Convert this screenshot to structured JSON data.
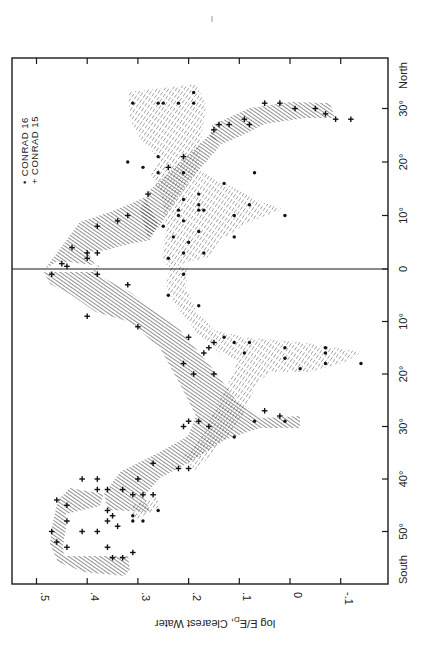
{
  "chart_data": {
    "type": "scatter",
    "title": "",
    "orientation": "rotated 90 degrees (value axis along bottom, latitude along right side)",
    "xlabel": "Latitude",
    "ylabel": "log E/E_D , Clearest Water",
    "value_axis": {
      "label": "log E/E",
      "label_sub": "D",
      "label_tail": ", Clearest Water",
      "ticks": [
        0.5,
        0.4,
        0.3,
        0.2,
        0.1,
        0,
        -0.1
      ],
      "tick_labels": [
        ".5",
        ".4",
        ".3",
        ".2",
        ".1",
        "0",
        "-.1"
      ],
      "range": [
        0.55,
        -0.19
      ]
    },
    "latitude_axis": {
      "ticks": [
        30,
        20,
        10,
        0,
        -10,
        -20,
        -30,
        -40,
        -50
      ],
      "tick_labels": [
        "30°",
        "20°",
        "10°",
        "0",
        "10°",
        "20°",
        "30°",
        "40°",
        "50°"
      ],
      "north_label": "North",
      "south_label": "South",
      "range": [
        -58,
        39
      ]
    },
    "legend": {
      "position": "upper-left inside frame (rotated text)",
      "entries": [
        {
          "marker": "dot",
          "symbol": "•",
          "label": "CONRAD 16"
        },
        {
          "marker": "plus",
          "symbol": "+",
          "label": "CONRAD 15"
        }
      ]
    },
    "grid": false,
    "reference_line": {
      "latitude": 0,
      "label": "Equator"
    },
    "series": [
      {
        "name": "CONRAD 15",
        "marker": "+",
        "hatch": "dense diagonal",
        "points": [
          {
            "lat": 31,
            "v": 0.05
          },
          {
            "lat": 31,
            "v": 0.02
          },
          {
            "lat": 30,
            "v": -0.01
          },
          {
            "lat": 30,
            "v": -0.05
          },
          {
            "lat": 29,
            "v": -0.07
          },
          {
            "lat": 28,
            "v": -0.09
          },
          {
            "lat": 28,
            "v": -0.12
          },
          {
            "lat": 28,
            "v": 0.09
          },
          {
            "lat": 27,
            "v": 0.08
          },
          {
            "lat": 27,
            "v": 0.12
          },
          {
            "lat": 27,
            "v": 0.14
          },
          {
            "lat": 26,
            "v": 0.15
          },
          {
            "lat": 21,
            "v": 0.21
          },
          {
            "lat": 19,
            "v": 0.24
          },
          {
            "lat": 14,
            "v": 0.28
          },
          {
            "lat": 10,
            "v": 0.32
          },
          {
            "lat": 9,
            "v": 0.34
          },
          {
            "lat": 8,
            "v": 0.38
          },
          {
            "lat": 4,
            "v": 0.43
          },
          {
            "lat": 3,
            "v": 0.4
          },
          {
            "lat": 3,
            "v": 0.38
          },
          {
            "lat": 2,
            "v": 0.4
          },
          {
            "lat": 1,
            "v": 0.45
          },
          {
            "lat": 0.5,
            "v": 0.44
          },
          {
            "lat": -1,
            "v": 0.47
          },
          {
            "lat": -1,
            "v": 0.38
          },
          {
            "lat": -3,
            "v": 0.32
          },
          {
            "lat": -9,
            "v": 0.4
          },
          {
            "lat": -11,
            "v": 0.3
          },
          {
            "lat": -13,
            "v": 0.2
          },
          {
            "lat": -14,
            "v": 0.15
          },
          {
            "lat": -15,
            "v": 0.16
          },
          {
            "lat": -16,
            "v": 0.17
          },
          {
            "lat": -18,
            "v": 0.21
          },
          {
            "lat": -20,
            "v": 0.19
          },
          {
            "lat": -20,
            "v": 0.15
          },
          {
            "lat": -27,
            "v": 0.05
          },
          {
            "lat": -28,
            "v": 0.02
          },
          {
            "lat": -29,
            "v": 0.2
          },
          {
            "lat": -29,
            "v": 0.18
          },
          {
            "lat": -30,
            "v": 0.16
          },
          {
            "lat": -30,
            "v": 0.21
          },
          {
            "lat": -37,
            "v": 0.27
          },
          {
            "lat": -38,
            "v": 0.2
          },
          {
            "lat": -38,
            "v": 0.22
          },
          {
            "lat": -40,
            "v": 0.41
          },
          {
            "lat": -40,
            "v": 0.38
          },
          {
            "lat": -40,
            "v": 0.3
          },
          {
            "lat": -42,
            "v": 0.38
          },
          {
            "lat": -42,
            "v": 0.36
          },
          {
            "lat": -42,
            "v": 0.33
          },
          {
            "lat": -43,
            "v": 0.31
          },
          {
            "lat": -43,
            "v": 0.29
          },
          {
            "lat": -43,
            "v": 0.27
          },
          {
            "lat": -44,
            "v": 0.46
          },
          {
            "lat": -45,
            "v": 0.44
          },
          {
            "lat": -46,
            "v": 0.36
          },
          {
            "lat": -47,
            "v": 0.35
          },
          {
            "lat": -48,
            "v": 0.44
          },
          {
            "lat": -48,
            "v": 0.36
          },
          {
            "lat": -49,
            "v": 0.34
          },
          {
            "lat": -50,
            "v": 0.41
          },
          {
            "lat": -50,
            "v": 0.38
          },
          {
            "lat": -50,
            "v": 0.47
          },
          {
            "lat": -52,
            "v": 0.46
          },
          {
            "lat": -53,
            "v": 0.44
          },
          {
            "lat": -53,
            "v": 0.36
          },
          {
            "lat": -54,
            "v": 0.31
          },
          {
            "lat": -55,
            "v": 0.35
          },
          {
            "lat": -55,
            "v": 0.33
          }
        ]
      },
      {
        "name": "CONRAD 16",
        "marker": "•",
        "hatch": "light dashed diagonal",
        "points": [
          {
            "lat": 33,
            "v": 0.19
          },
          {
            "lat": 31,
            "v": 0.31
          },
          {
            "lat": 31,
            "v": 0.26
          },
          {
            "lat": 31,
            "v": 0.25
          },
          {
            "lat": 31,
            "v": 0.22
          },
          {
            "lat": 31,
            "v": 0.19
          },
          {
            "lat": 21,
            "v": 0.26
          },
          {
            "lat": 20,
            "v": 0.32
          },
          {
            "lat": 19,
            "v": 0.29
          },
          {
            "lat": 18,
            "v": 0.26
          },
          {
            "lat": 18,
            "v": 0.21
          },
          {
            "lat": 18,
            "v": 0.07
          },
          {
            "lat": 16,
            "v": 0.13
          },
          {
            "lat": 14,
            "v": 0.18
          },
          {
            "lat": 13,
            "v": 0.21
          },
          {
            "lat": 12,
            "v": 0.18
          },
          {
            "lat": 12,
            "v": 0.08
          },
          {
            "lat": 11,
            "v": 0.22
          },
          {
            "lat": 11,
            "v": 0.18
          },
          {
            "lat": 11,
            "v": 0.17
          },
          {
            "lat": 10,
            "v": 0.22
          },
          {
            "lat": 10,
            "v": 0.11
          },
          {
            "lat": 10,
            "v": 0.01
          },
          {
            "lat": 9,
            "v": 0.21
          },
          {
            "lat": 8,
            "v": 0.25
          },
          {
            "lat": 7,
            "v": 0.18
          },
          {
            "lat": 6,
            "v": 0.23
          },
          {
            "lat": 6,
            "v": 0.11
          },
          {
            "lat": 5,
            "v": 0.2
          },
          {
            "lat": 3,
            "v": 0.21
          },
          {
            "lat": 3,
            "v": 0.17
          },
          {
            "lat": 2,
            "v": 0.24
          },
          {
            "lat": -1,
            "v": 0.21
          },
          {
            "lat": -5,
            "v": 0.24
          },
          {
            "lat": -7,
            "v": 0.18
          },
          {
            "lat": -13,
            "v": 0.13
          },
          {
            "lat": -14,
            "v": 0.11
          },
          {
            "lat": -14,
            "v": 0.08
          },
          {
            "lat": -15,
            "v": 0.01
          },
          {
            "lat": -15,
            "v": -0.07
          },
          {
            "lat": -16,
            "v": 0.09
          },
          {
            "lat": -16,
            "v": -0.07
          },
          {
            "lat": -17,
            "v": 0.01
          },
          {
            "lat": -18,
            "v": -0.14
          },
          {
            "lat": -18,
            "v": -0.07
          },
          {
            "lat": -19,
            "v": -0.02
          },
          {
            "lat": -29,
            "v": 0.01
          },
          {
            "lat": -29,
            "v": 0.07
          },
          {
            "lat": -32,
            "v": 0.11
          },
          {
            "lat": -46,
            "v": 0.26
          },
          {
            "lat": -47,
            "v": 0.31
          },
          {
            "lat": -48,
            "v": 0.29
          },
          {
            "lat": -48,
            "v": 0.31
          }
        ]
      }
    ],
    "regions": [
      {
        "series": "CONRAD 15",
        "description": "southern belt 38°S–56°S, values .30–.48"
      },
      {
        "series": "CONRAD 15",
        "description": "diagonal band from 38°S (.25) to 0° (.48)"
      },
      {
        "series": "CONRAD 15",
        "description": "band from 0° (.46) to 10°N (.31), crossing to 25°N (.15) and arm to 30°N (-.12)"
      },
      {
        "series": "CONRAD 16",
        "description": "northern fan 2°N–33°N, values .00–.32"
      },
      {
        "series": "CONRAD 16",
        "description": "southern arc 0°–28°S with lobe to -.15 at 18°S"
      }
    ]
  }
}
